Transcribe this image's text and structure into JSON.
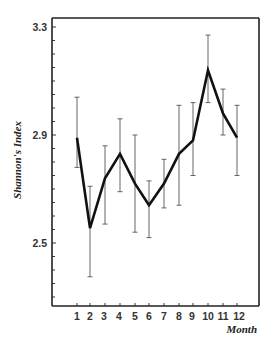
{
  "chart_data": {
    "type": "line",
    "title": "",
    "xlabel": "Month",
    "ylabel": "Shannon's Index",
    "categories": [
      "1",
      "2",
      "3",
      "4",
      "5",
      "6",
      "7",
      "8",
      "9",
      "10",
      "11",
      "12"
    ],
    "series": [
      {
        "name": "Shannon's Index",
        "values": [
          2.89,
          2.555,
          2.74,
          2.83,
          2.72,
          2.64,
          2.72,
          2.83,
          2.88,
          3.14,
          2.98,
          2.89
        ],
        "error_upper": [
          3.04,
          2.71,
          2.86,
          2.96,
          2.9,
          2.73,
          2.81,
          3.01,
          3.02,
          3.27,
          3.07,
          3.01
        ],
        "error_lower": [
          2.78,
          2.375,
          2.57,
          2.69,
          2.54,
          2.52,
          2.63,
          2.64,
          2.75,
          3.02,
          2.9,
          2.75
        ]
      }
    ],
    "ylim": [
      2.267,
      3.333
    ],
    "yticks_major": [
      2.5,
      2.9,
      3.3
    ],
    "yticks_major_labels": [
      "2.5",
      "2.9",
      "3.3"
    ],
    "yticks_minor_step": 0.05,
    "grid": false,
    "legend": "none",
    "error_bars": true
  },
  "layout": {
    "frame": {
      "left": 52,
      "top": 18,
      "right": 259,
      "bottom": 306
    },
    "y_ref": {
      "value": 2.9,
      "pixel": 135,
      "px_per_unit": 270
    },
    "x_positions": [
      77,
      90,
      105,
      120,
      135,
      149,
      164,
      179,
      193,
      208,
      223,
      237
    ],
    "x_label_positions": [
      77,
      90,
      104,
      119,
      135,
      149,
      164,
      179,
      192,
      208,
      223,
      239
    ],
    "colors": {
      "line": "#111111",
      "axis": "#222222",
      "errorbar": "#555555",
      "text": "#333333"
    }
  }
}
